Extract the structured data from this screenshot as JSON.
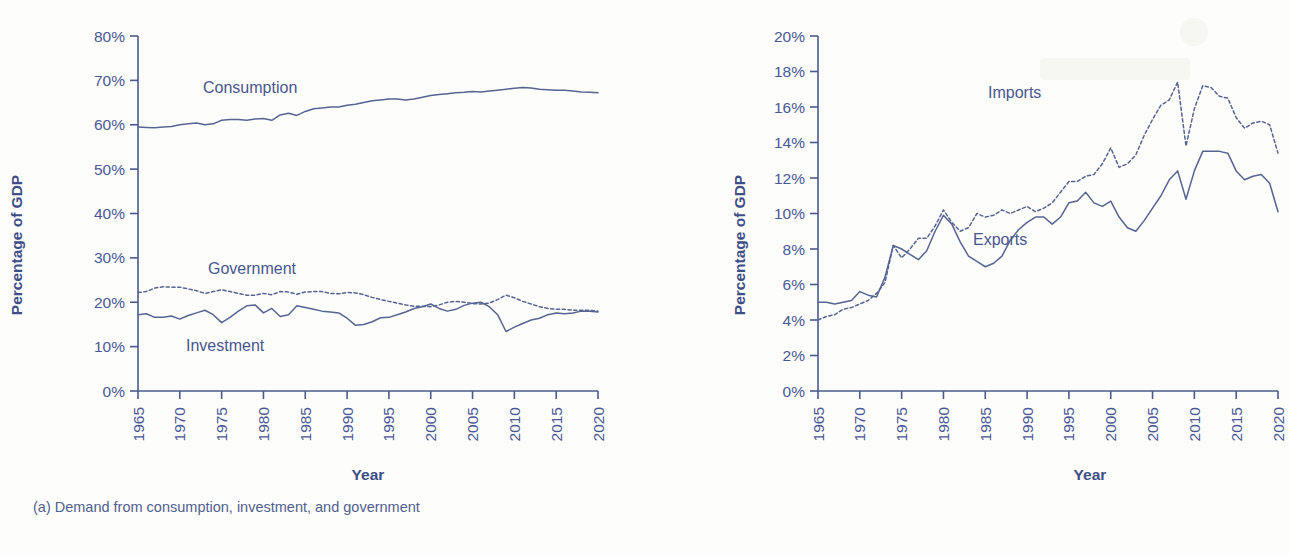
{
  "figure": {
    "background_color": "#fdfdfb",
    "ink_color": "#4a5896"
  },
  "panel_a": {
    "caption": "(a) Demand from consumption, investment, and government",
    "ylabel": "Percentage of GDP",
    "xlabel": "Year",
    "series_labels": {
      "consumption": "Consumption",
      "government": "Government",
      "investment": "Investment"
    }
  },
  "panel_b": {
    "caption": "(b) Imports and exports",
    "ylabel": "Percentage of GDP",
    "xlabel": "Year",
    "series_labels": {
      "imports": "Imports",
      "exports": "Exports"
    }
  },
  "chart_data": [
    {
      "id": "panel_a",
      "type": "line",
      "title": "(a) Demand from consumption, investment, and government",
      "xlabel": "Year",
      "ylabel": "Percentage of GDP",
      "xlim": [
        1965,
        2020
      ],
      "ylim": [
        0,
        80
      ],
      "ytick_labels": [
        "0%",
        "10%",
        "20%",
        "30%",
        "40%",
        "50%",
        "60%",
        "70%",
        "80%"
      ],
      "ytick_values": [
        0,
        10,
        20,
        30,
        40,
        50,
        60,
        70,
        80
      ],
      "xtick_labels": [
        "1965",
        "1970",
        "1975",
        "1980",
        "1985",
        "1990",
        "1995",
        "2000",
        "2005",
        "2010",
        "2015",
        "2020"
      ],
      "xtick_values": [
        1965,
        1970,
        1975,
        1980,
        1985,
        1990,
        1995,
        2000,
        2005,
        2010,
        2015,
        2020
      ],
      "grid": false,
      "legend": "inline-annotations",
      "x": [
        1965,
        1966,
        1967,
        1968,
        1969,
        1970,
        1971,
        1972,
        1973,
        1974,
        1975,
        1976,
        1977,
        1978,
        1979,
        1980,
        1981,
        1982,
        1983,
        1984,
        1985,
        1986,
        1987,
        1988,
        1989,
        1990,
        1991,
        1992,
        1993,
        1994,
        1995,
        1996,
        1997,
        1998,
        1999,
        2000,
        2001,
        2002,
        2003,
        2004,
        2005,
        2006,
        2007,
        2008,
        2009,
        2010,
        2011,
        2012,
        2013,
        2014,
        2015,
        2016,
        2017,
        2018,
        2019,
        2020
      ],
      "series": [
        {
          "name": "Consumption",
          "style": "solid",
          "values": [
            59.5,
            59.4,
            59.3,
            59.5,
            59.6,
            60.0,
            60.2,
            60.4,
            60.0,
            60.2,
            61.0,
            61.2,
            61.2,
            61.0,
            61.3,
            61.4,
            61.0,
            62.2,
            62.6,
            62.1,
            63.0,
            63.6,
            63.8,
            64.0,
            64.0,
            64.4,
            64.6,
            65.0,
            65.4,
            65.6,
            65.8,
            65.8,
            65.6,
            65.8,
            66.2,
            66.6,
            66.8,
            67.0,
            67.2,
            67.3,
            67.5,
            67.4,
            67.6,
            67.8,
            68.0,
            68.2,
            68.4,
            68.3,
            68.0,
            67.9,
            67.8,
            67.8,
            67.6,
            67.4,
            67.3,
            67.2
          ]
        },
        {
          "name": "Government",
          "style": "dotted",
          "values": [
            22.2,
            22.4,
            23.2,
            23.5,
            23.4,
            23.4,
            23.0,
            22.6,
            22.0,
            22.4,
            22.8,
            22.4,
            22.0,
            21.6,
            21.6,
            22.0,
            21.7,
            22.4,
            22.3,
            21.8,
            22.3,
            22.4,
            22.4,
            22.0,
            21.9,
            22.2,
            22.1,
            21.7,
            21.1,
            20.6,
            20.2,
            19.8,
            19.4,
            19.1,
            19.1,
            19.0,
            19.4,
            20.0,
            20.2,
            20.0,
            19.7,
            19.6,
            19.8,
            20.6,
            21.6,
            21.0,
            20.2,
            19.6,
            19.0,
            18.6,
            18.4,
            18.4,
            18.2,
            18.2,
            18.2,
            18.0
          ]
        },
        {
          "name": "Investment",
          "style": "solid",
          "values": [
            17.2,
            17.4,
            16.6,
            16.6,
            16.9,
            16.2,
            17.0,
            17.6,
            18.2,
            17.2,
            15.4,
            16.6,
            18.0,
            19.2,
            19.4,
            17.6,
            18.6,
            16.8,
            17.2,
            19.2,
            18.8,
            18.4,
            18.0,
            17.8,
            17.6,
            16.4,
            14.8,
            15.0,
            15.6,
            16.5,
            16.6,
            17.2,
            17.8,
            18.6,
            19.0,
            19.6,
            18.6,
            18.0,
            18.4,
            19.3,
            19.8,
            20.0,
            19.0,
            17.2,
            13.4,
            14.4,
            15.2,
            16.0,
            16.4,
            17.2,
            17.6,
            17.4,
            17.6,
            18.0,
            18.0,
            17.8
          ]
        }
      ]
    },
    {
      "id": "panel_b",
      "type": "line",
      "title": "(b) Imports and exports",
      "xlabel": "Year",
      "ylabel": "Percentage of GDP",
      "xlim": [
        1965,
        2020
      ],
      "ylim": [
        0,
        20
      ],
      "ytick_labels": [
        "0%",
        "2%",
        "4%",
        "6%",
        "8%",
        "10%",
        "12%",
        "14%",
        "16%",
        "18%",
        "20%"
      ],
      "ytick_values": [
        0,
        2,
        4,
        6,
        8,
        10,
        12,
        14,
        16,
        18,
        20
      ],
      "xtick_labels": [
        "1965",
        "1970",
        "1975",
        "1980",
        "1985",
        "1990",
        "1995",
        "2000",
        "2005",
        "2010",
        "2015",
        "2020"
      ],
      "xtick_values": [
        1965,
        1970,
        1975,
        1980,
        1985,
        1990,
        1995,
        2000,
        2005,
        2010,
        2015,
        2020
      ],
      "grid": false,
      "legend": "inline-annotations",
      "x": [
        1965,
        1966,
        1967,
        1968,
        1969,
        1970,
        1971,
        1972,
        1973,
        1974,
        1975,
        1976,
        1977,
        1978,
        1979,
        1980,
        1981,
        1982,
        1983,
        1984,
        1985,
        1986,
        1987,
        1988,
        1989,
        1990,
        1991,
        1992,
        1993,
        1994,
        1995,
        1996,
        1997,
        1998,
        1999,
        2000,
        2001,
        2002,
        2003,
        2004,
        2005,
        2006,
        2007,
        2008,
        2009,
        2010,
        2011,
        2012,
        2013,
        2014,
        2015,
        2016,
        2017,
        2018,
        2019,
        2020
      ],
      "series": [
        {
          "name": "Imports",
          "style": "dotted",
          "values": [
            4.0,
            4.2,
            4.3,
            4.6,
            4.7,
            4.9,
            5.1,
            5.5,
            6.1,
            8.2,
            7.5,
            8.0,
            8.6,
            8.6,
            9.3,
            10.2,
            9.5,
            9.0,
            9.2,
            10.0,
            9.8,
            9.9,
            10.2,
            10.0,
            10.2,
            10.4,
            10.1,
            10.3,
            10.6,
            11.2,
            11.8,
            11.8,
            12.1,
            12.2,
            12.8,
            13.7,
            12.6,
            12.8,
            13.3,
            14.4,
            15.3,
            16.1,
            16.4,
            17.4,
            13.8,
            15.9,
            17.2,
            17.1,
            16.6,
            16.5,
            15.4,
            14.8,
            15.1,
            15.2,
            15.0,
            13.4
          ]
        },
        {
          "name": "Exports",
          "style": "solid",
          "values": [
            5.0,
            5.0,
            4.9,
            5.0,
            5.1,
            5.6,
            5.4,
            5.3,
            6.4,
            8.2,
            8.0,
            7.7,
            7.4,
            7.9,
            9.0,
            9.9,
            9.4,
            8.4,
            7.6,
            7.3,
            7.0,
            7.2,
            7.6,
            8.5,
            9.1,
            9.5,
            9.8,
            9.8,
            9.4,
            9.8,
            10.6,
            10.7,
            11.2,
            10.6,
            10.4,
            10.7,
            9.8,
            9.2,
            9.0,
            9.6,
            10.3,
            11.0,
            11.9,
            12.4,
            10.8,
            12.4,
            13.5,
            13.5,
            13.5,
            13.4,
            12.4,
            11.9,
            12.1,
            12.2,
            11.7,
            10.1
          ]
        }
      ]
    }
  ]
}
